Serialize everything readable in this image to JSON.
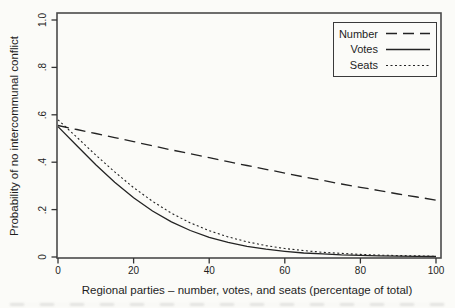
{
  "colors": {
    "line": "#232323",
    "frame": "#4a4a4a",
    "tick": "#333333",
    "background": "#fbfbf8",
    "text": "#1e1e1e"
  },
  "chart_data": {
    "type": "line",
    "title": "",
    "xlabel": "Regional parties – number, votes, and seats (percentage of total)",
    "ylabel": "Probability of no intercommunal conflict",
    "xlim": [
      0,
      100
    ],
    "ylim": [
      0,
      1
    ],
    "grid": false,
    "legend_position": "top-right-inside",
    "xticks": [
      "0",
      "20",
      "40",
      "60",
      "80",
      "100"
    ],
    "xtick_values": [
      0,
      20,
      40,
      60,
      80,
      100
    ],
    "yticks": [
      "0",
      ".2",
      ".4",
      ".6",
      ".8",
      "1.0"
    ],
    "ytick_values": [
      0,
      0.2,
      0.4,
      0.6,
      0.8,
      1.0
    ],
    "x": [
      0,
      5,
      10,
      15,
      20,
      25,
      30,
      35,
      40,
      45,
      50,
      55,
      60,
      65,
      70,
      75,
      80,
      85,
      90,
      95,
      100
    ],
    "series": [
      {
        "name": "Number",
        "line_style": "long-dash",
        "values": [
          0.555,
          0.538,
          0.521,
          0.504,
          0.487,
          0.469,
          0.452,
          0.436,
          0.419,
          0.402,
          0.386,
          0.37,
          0.354,
          0.338,
          0.323,
          0.308,
          0.294,
          0.28,
          0.266,
          0.253,
          0.24
        ]
      },
      {
        "name": "Votes",
        "line_style": "solid",
        "values": [
          0.55,
          0.469,
          0.389,
          0.315,
          0.25,
          0.194,
          0.148,
          0.112,
          0.083,
          0.062,
          0.045,
          0.033,
          0.024,
          0.017,
          0.013,
          0.009,
          0.007,
          0.005,
          0.004,
          0.003,
          0.002
        ]
      },
      {
        "name": "Seats",
        "line_style": "dot",
        "values": [
          0.579,
          0.505,
          0.43,
          0.359,
          0.293,
          0.235,
          0.185,
          0.144,
          0.111,
          0.085,
          0.064,
          0.048,
          0.036,
          0.027,
          0.02,
          0.015,
          0.011,
          0.008,
          0.006,
          0.005,
          0.003
        ]
      }
    ]
  }
}
